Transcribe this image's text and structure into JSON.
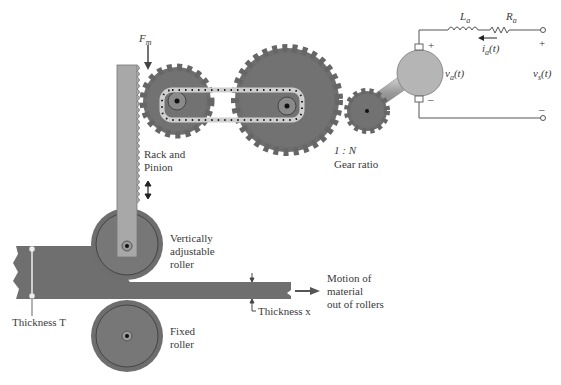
{
  "diagram": {
    "labels": {
      "force": "F",
      "force_sub": "m",
      "rack_pinion": [
        "Rack and",
        "Pinion"
      ],
      "gear_ratio_value": "1 : N",
      "gear_ratio": "Gear ratio",
      "adjustable_roller": [
        "Vertically",
        "adjustable",
        "roller"
      ],
      "fixed_roller": [
        "Fixed",
        "roller"
      ],
      "motion": [
        "Motion of",
        "material",
        "out of rollers"
      ],
      "thickness_T": "Thickness T",
      "thickness_x": "Thickness x",
      "inductor": "L",
      "inductor_sub": "a",
      "resistor": "R",
      "resistor_sub": "a",
      "current": "i",
      "current_sub": "a",
      "current_arg": "(t)",
      "motor_voltage": "v",
      "motor_voltage_sub": "a",
      "motor_voltage_arg": "(t)",
      "source_voltage": "v",
      "source_voltage_sub": "s",
      "source_voltage_arg": "(t)",
      "plus": "+",
      "minus": "–"
    },
    "colors": {
      "metal": "#7c7c7c",
      "metal_dark": "#5e5e5e",
      "metal_light": "#9a9a9a",
      "rack": "#a9a9a9",
      "motor": "#b5b5b5",
      "wire": "#555555"
    }
  }
}
